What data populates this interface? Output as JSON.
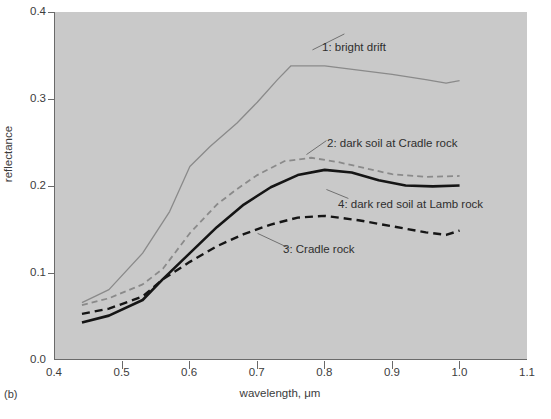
{
  "figure": {
    "panel_letter": "(b)",
    "caption_fragment": ""
  },
  "chart_data": {
    "type": "line",
    "title": "",
    "xlabel": "wavelength, μm",
    "ylabel": "reflectance",
    "xlim": [
      0.4,
      1.1
    ],
    "ylim": [
      0.0,
      0.4
    ],
    "xticks": [
      "0.4",
      "0.5",
      "0.6",
      "0.7",
      "0.8",
      "0.9",
      "1.0",
      "1.1"
    ],
    "xtick_values": [
      0.4,
      0.5,
      0.6,
      0.7,
      0.8,
      0.9,
      1.0,
      1.1
    ],
    "yticks": [
      "0.0",
      "0.1",
      "0.2",
      "0.3",
      "0.4"
    ],
    "ytick_values": [
      0.0,
      0.1,
      0.2,
      0.3,
      0.4
    ],
    "grid": false,
    "legend_position": "inline-annotations",
    "plot_background": "#c9c9c9",
    "series": [
      {
        "name": "1: bright drift",
        "style": "solid",
        "color": "#8a8a8a",
        "width": 1.3,
        "x": [
          0.44,
          0.48,
          0.53,
          0.57,
          0.6,
          0.63,
          0.67,
          0.7,
          0.73,
          0.75,
          0.8,
          0.85,
          0.9,
          0.95,
          0.98,
          1.0
        ],
        "y": [
          0.065,
          0.08,
          0.122,
          0.17,
          0.222,
          0.245,
          0.272,
          0.296,
          0.322,
          0.338,
          0.338,
          0.333,
          0.328,
          0.322,
          0.318,
          0.321
        ]
      },
      {
        "name": "2: dark soil at Cradle rock",
        "style": "dashed",
        "color": "#8a8a8a",
        "width": 1.8,
        "x": [
          0.44,
          0.48,
          0.53,
          0.56,
          0.6,
          0.64,
          0.67,
          0.7,
          0.74,
          0.78,
          0.82,
          0.86,
          0.9,
          0.95,
          1.0
        ],
        "y": [
          0.062,
          0.07,
          0.086,
          0.104,
          0.145,
          0.178,
          0.196,
          0.212,
          0.228,
          0.232,
          0.227,
          0.22,
          0.213,
          0.21,
          0.211
        ]
      },
      {
        "name": "3: Cradle rock",
        "style": "dashed",
        "color": "#151515",
        "width": 2.4,
        "x": [
          0.44,
          0.48,
          0.53,
          0.56,
          0.6,
          0.64,
          0.68,
          0.72,
          0.76,
          0.8,
          0.85,
          0.9,
          0.95,
          0.98,
          1.0
        ],
        "y": [
          0.052,
          0.058,
          0.072,
          0.092,
          0.112,
          0.13,
          0.144,
          0.155,
          0.163,
          0.165,
          0.16,
          0.153,
          0.146,
          0.143,
          0.148
        ]
      },
      {
        "name": "4: dark red soil at Lamb rock",
        "style": "solid",
        "color": "#151515",
        "width": 2.6,
        "x": [
          0.44,
          0.48,
          0.53,
          0.56,
          0.6,
          0.64,
          0.68,
          0.72,
          0.76,
          0.8,
          0.84,
          0.88,
          0.92,
          0.96,
          1.0
        ],
        "y": [
          0.042,
          0.05,
          0.068,
          0.092,
          0.122,
          0.152,
          0.178,
          0.198,
          0.212,
          0.218,
          0.215,
          0.206,
          0.2,
          0.199,
          0.2
        ]
      }
    ],
    "annotations": [
      {
        "text": "1: bright drift",
        "series": 1
      },
      {
        "text": "2: dark soil at Cradle rock",
        "series": 2
      },
      {
        "text": "4: dark red soil at Lamb rock",
        "series": 4
      },
      {
        "text": "3: Cradle rock",
        "series": 3
      }
    ]
  }
}
